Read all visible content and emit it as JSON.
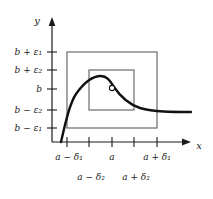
{
  "figure": {
    "axes": {
      "x_axis_label": "x",
      "y_axis_label": "y",
      "axis_color": "#1a1a1a"
    },
    "y_ticks": [
      {
        "label": "b + ε1",
        "text": "b + ε₁",
        "y": 52
      },
      {
        "label": "b + ε2",
        "text": "b + ε₂",
        "y": 70
      },
      {
        "label": "b",
        "text": "b",
        "y": 89
      },
      {
        "label": "b − ε2",
        "text": "b − ε₂",
        "y": 110
      },
      {
        "label": "b − ε1",
        "text": "b − ε₁",
        "y": 128
      }
    ],
    "x_ticks": [
      {
        "label": "a − δ1",
        "text": "a − δ₁",
        "x": 67,
        "row": 1
      },
      {
        "label": "a − δ2",
        "text": "a − δ₂",
        "x": 89,
        "row": 2
      },
      {
        "label": "a",
        "text": "a",
        "x": 112,
        "row": 1
      },
      {
        "label": "a + δ2",
        "text": "a + δ₂",
        "x": 134,
        "row": 2
      },
      {
        "label": "a + δ1",
        "text": "a + δ₁",
        "x": 157,
        "row": 1
      }
    ],
    "rectangles": [
      {
        "name": "outer-epsilon-delta-rectangle",
        "x": 67,
        "y": 52,
        "width": 90,
        "height": 76,
        "stroke": "#6b6b6b"
      },
      {
        "name": "inner-epsilon-delta-rectangle",
        "x": 89,
        "y": 70,
        "width": 45,
        "height": 40,
        "stroke": "#6b6b6b"
      }
    ],
    "curve": {
      "name": "function-curve",
      "stroke": "#111111",
      "stroke_width": 2.4,
      "path": "M 61 142 C 66 120 70 103 76 94 C 83 84 92 76 101 76 C 107 76 110 81 114 87 C 120 96 128 104 140 108 C 154 112 172 112 191 112"
    },
    "hole_point": {
      "name": "removable-discontinuity-point",
      "x": 112,
      "y": 88,
      "radius": 2.6,
      "fill": "#ffffff",
      "stroke": "#111111"
    }
  }
}
